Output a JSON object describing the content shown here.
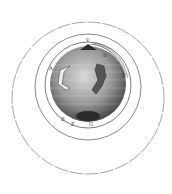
{
  "diagram": {
    "colors": {
      "background": "#ffffff",
      "line": "#555555",
      "globe_dark": "#3a3a3a",
      "globe_mid": "#8a8a8a",
      "globe_light": "#d8d8d8"
    },
    "labels": [
      {
        "id": "V",
        "text": "V"
      },
      {
        "id": "D",
        "text": "D"
      },
      {
        "id": "E",
        "text": "E"
      },
      {
        "id": "A",
        "text": "A"
      },
      {
        "id": "B",
        "text": "B"
      },
      {
        "id": "F",
        "text": "F"
      },
      {
        "id": "G",
        "text": "G"
      }
    ],
    "orbits": [
      {
        "name": "outer-orbit",
        "cx": 88,
        "cy": 98,
        "r": 76
      },
      {
        "name": "middle-orbit",
        "cx": 88,
        "cy": 87,
        "r": 53
      },
      {
        "name": "inner-orbit",
        "cx": 88,
        "cy": 85,
        "r": 43
      }
    ],
    "globe": {
      "cx": 88,
      "cy": 84,
      "r": 38
    }
  }
}
